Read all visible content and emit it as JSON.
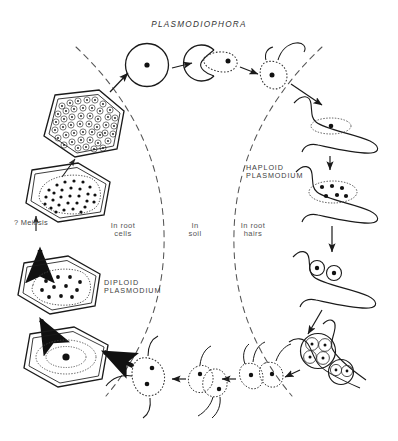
{
  "figure": {
    "title": "PLASMODIOPHORA",
    "background_color": "#ffffff",
    "ink_color": "#1a1a1a",
    "label_color": "#3a3a3a"
  },
  "labels": {
    "title": "PLASMODIOPHORA",
    "in_root_cells": "In root\ncells",
    "in_soil": "In\nsoil",
    "in_root_hairs": "In root\nhairs",
    "haploid_plasmodium": "HAPLOID\nPLASMODIUM",
    "diploid_plasmodium": "DIPLOID\nPLASMODIUM",
    "meiosis": "? Meiosis"
  },
  "zones": [
    {
      "name": "in-root-cells",
      "label": "In root cells",
      "side": "left"
    },
    {
      "name": "in-soil",
      "label": "In soil",
      "side": "center"
    },
    {
      "name": "in-root-hairs",
      "label": "In root hairs",
      "side": "right"
    }
  ],
  "stages": [
    {
      "id": "resting-spore",
      "label": "Resting spore",
      "x": 147,
      "y": 65,
      "zone": "in-soil"
    },
    {
      "id": "germinating-spore",
      "label": "Germinating resting spore",
      "x": 205,
      "y": 62,
      "zone": "in-soil"
    },
    {
      "id": "primary-zoospore",
      "label": "Primary zoospore (biflagellate)",
      "x": 258,
      "y": 72,
      "zone": "in-soil"
    },
    {
      "id": "root-hair-infection",
      "label": "Zoospore encysted on root hair",
      "x": 330,
      "y": 125,
      "zone": "in-root-hairs"
    },
    {
      "id": "haploid-plasmodium",
      "label": "Haploid plasmodium in root hair",
      "x": 330,
      "y": 183,
      "zone": "in-root-hairs"
    },
    {
      "id": "binucleate-stage",
      "label": "Binucleate stage",
      "x": 325,
      "y": 268,
      "zone": "in-root-hairs"
    },
    {
      "id": "zoosporangia",
      "label": "Zoosporangia with secondary zoospores",
      "x": 330,
      "y": 340,
      "zone": "in-root-hairs"
    },
    {
      "id": "secondary-zoospores",
      "label": "Secondary zoospores released",
      "x": 270,
      "y": 378,
      "zone": "in-soil"
    },
    {
      "id": "fusing-zoospores",
      "label": "Fusing zoospores (plasmogamy)",
      "x": 205,
      "y": 382,
      "zone": "in-soil"
    },
    {
      "id": "zygote",
      "label": "Zygote zoospore",
      "x": 143,
      "y": 378,
      "zone": "in-soil"
    },
    {
      "id": "infected-root-cell",
      "label": "Root cell with diploid nucleus",
      "x": 78,
      "y": 352,
      "zone": "in-root-cells"
    },
    {
      "id": "diploid-plasmodium-cell",
      "label": "Root cell with diploid plasmodium",
      "x": 78,
      "y": 281,
      "zone": "in-root-cells"
    },
    {
      "id": "meiosis-cell",
      "label": "Root cell after meiosis (many nuclei)",
      "x": 78,
      "y": 186,
      "zone": "in-root-cells"
    },
    {
      "id": "resting-spore-cell",
      "label": "Root cell packed with resting spores",
      "x": 80,
      "y": 122,
      "zone": "in-root-cells"
    }
  ],
  "arrows": [
    {
      "from": "resting-spore-cell",
      "to": "resting-spore",
      "style": "solid"
    },
    {
      "from": "resting-spore",
      "to": "germinating-spore",
      "style": "solid"
    },
    {
      "from": "germinating-spore",
      "to": "primary-zoospore",
      "style": "solid"
    },
    {
      "from": "primary-zoospore",
      "to": "root-hair-infection",
      "style": "solid"
    },
    {
      "from": "root-hair-infection",
      "to": "haploid-plasmodium",
      "style": "solid"
    },
    {
      "from": "haploid-plasmodium",
      "to": "binucleate-stage",
      "style": "solid"
    },
    {
      "from": "binucleate-stage",
      "to": "zoosporangia",
      "style": "solid"
    },
    {
      "from": "zoosporangia",
      "to": "secondary-zoospores",
      "style": "solid"
    },
    {
      "from": "secondary-zoospores",
      "to": "fusing-zoospores",
      "style": "solid"
    },
    {
      "from": "fusing-zoospores",
      "to": "zygote",
      "style": "solid"
    },
    {
      "from": "zygote",
      "to": "infected-root-cell",
      "style": "thick"
    },
    {
      "from": "infected-root-cell",
      "to": "diploid-plasmodium-cell",
      "style": "thick"
    },
    {
      "from": "diploid-plasmodium-cell",
      "to": "meiosis-cell",
      "style": "thin"
    },
    {
      "from": "meiosis-cell",
      "to": "resting-spore-cell",
      "style": "thin"
    }
  ]
}
